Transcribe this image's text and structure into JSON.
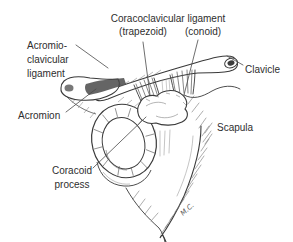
{
  "figure": {
    "labels": {
      "coracoclavicular_title": "Coracoclavicular ligament",
      "trapezoid": "(trapezoid)",
      "conoid": "(conoid)",
      "acromioclavicular_line1": "Acromio-",
      "acromioclavicular_line2": "clavicular",
      "acromioclavicular_line3": "ligament",
      "clavicle": "Clavicle",
      "acromion": "Acromion",
      "scapula": "Scapula",
      "coracoid_line1": "Coracoid",
      "coracoid_line2": "process",
      "signature": "M.C."
    },
    "colors": {
      "ink": "#3a3a3a",
      "ink_light": "#777777",
      "leader_line": "#4a4a4a",
      "label_text": "#2e2e2e",
      "background": "#ffffff"
    }
  }
}
